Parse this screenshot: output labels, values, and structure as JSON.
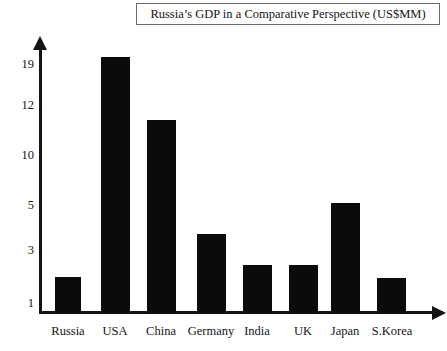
{
  "chart_data": {
    "type": "bar",
    "title": "Russia’s GDP in a Comparative Perspective (US$MM)",
    "xlabel": "",
    "ylabel": "",
    "categories": [
      "Russia",
      "USA",
      "China",
      "Germany",
      "India",
      "UK",
      "Japan",
      "S.Korea"
    ],
    "values": [
      2,
      19,
      11.3,
      3.7,
      2.3,
      2.3,
      5.1,
      2
    ],
    "ytick_labels": [
      "19",
      "12",
      "10",
      "5",
      "3",
      "1"
    ],
    "ytick_values": [
      19,
      12,
      10,
      5,
      3,
      1
    ],
    "yaxis_nonlinear": true,
    "ylim": [
      0,
      19
    ],
    "grid": false,
    "legend": false,
    "bar_color": "#0b0b0b",
    "axis_color": "#141414",
    "background_color": "#ffffff"
  },
  "title": {
    "text": "Russia’s GDP in a Comparative Perspective (US$MM)"
  },
  "axes": {
    "y_ticks": [
      {
        "label": "19",
        "y": 64
      },
      {
        "label": "12",
        "y": 105
      },
      {
        "label": "10",
        "y": 155
      },
      {
        "label": "5",
        "y": 205
      },
      {
        "label": "3",
        "y": 250
      },
      {
        "label": "1",
        "y": 303
      }
    ],
    "x_ticks": [
      {
        "label": "Russia",
        "x": 68
      },
      {
        "label": "USA",
        "x": 115
      },
      {
        "label": "China",
        "x": 161
      },
      {
        "label": "Germany",
        "x": 211
      },
      {
        "label": "India",
        "x": 257
      },
      {
        "label": "UK",
        "x": 303
      },
      {
        "label": "Japan",
        "x": 345
      },
      {
        "label": "S.Korea",
        "x": 392
      }
    ]
  },
  "bars": [
    {
      "name": "Russia",
      "x": 55,
      "width": 26,
      "top": 277,
      "value": 2
    },
    {
      "name": "USA",
      "x": 101,
      "width": 29,
      "top": 57,
      "value": 19
    },
    {
      "name": "China",
      "x": 147,
      "width": 29,
      "top": 120,
      "value": 11.3
    },
    {
      "name": "Germany",
      "x": 197,
      "width": 29,
      "top": 234,
      "value": 3.7
    },
    {
      "name": "India",
      "x": 243,
      "width": 29,
      "top": 265,
      "value": 2.3
    },
    {
      "name": "UK",
      "x": 289,
      "width": 29,
      "top": 265,
      "value": 2.3
    },
    {
      "name": "Japan",
      "x": 331,
      "width": 29,
      "top": 203,
      "value": 5.1
    },
    {
      "name": "S.Korea",
      "x": 377,
      "width": 29,
      "top": 278,
      "value": 2
    }
  ]
}
